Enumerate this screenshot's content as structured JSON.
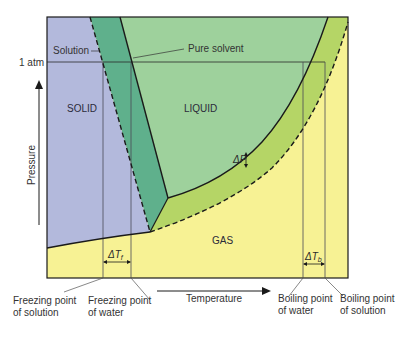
{
  "colors": {
    "solid": "#b3b9dc",
    "liquid": "#9ed19c",
    "liquid_band": "#5fb08c",
    "gas": "#f7f294",
    "gas_band": "#b5d566",
    "line": "#1a1a1a"
  },
  "regions": {
    "solid": "SOLID",
    "liquid": "LIQUID",
    "gas": "GAS"
  },
  "labels": {
    "solution": "Solution",
    "pure_solvent": "Pure solvent",
    "one_atm": "1 atm",
    "delta_p": "ΔP",
    "delta_tf_main": "ΔT",
    "delta_tf_sub": "f",
    "delta_tb_main": "ΔT",
    "delta_tb_sub": "b"
  },
  "axes": {
    "x_label": "Temperature",
    "y_label": "Pressure"
  },
  "annotations": {
    "freezing_solution_1": "Freezing point",
    "freezing_solution_2": "of solution",
    "freezing_water_1": "Freezing point",
    "freezing_water_2": "of water",
    "boiling_water_1": "Boiling point",
    "boiling_water_2": "of water",
    "boiling_solution_1": "Boiling point",
    "boiling_solution_2": "of solution"
  }
}
